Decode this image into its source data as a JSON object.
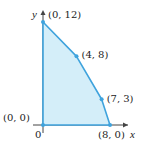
{
  "chart_data": {
    "type": "area",
    "title": "",
    "xlabel": "x",
    "ylabel": "y",
    "origin_label": "0",
    "xlim": [
      0,
      8
    ],
    "ylim": [
      0,
      12
    ],
    "grid": false,
    "legend": null,
    "region": "feasible region (shaded polygon)",
    "vertices": [
      {
        "x": 0,
        "y": 0,
        "label": "(0, 0)"
      },
      {
        "x": 0,
        "y": 12,
        "label": "(0, 12)"
      },
      {
        "x": 4,
        "y": 8,
        "label": "(4, 8)"
      },
      {
        "x": 7,
        "y": 3,
        "label": "(7, 3)"
      },
      {
        "x": 8,
        "y": 0,
        "label": "(8, 0)"
      }
    ]
  },
  "colors": {
    "fill": "#d4eef9",
    "edge": "#3fa3dd",
    "axis": "#444444",
    "text": "#222222"
  }
}
